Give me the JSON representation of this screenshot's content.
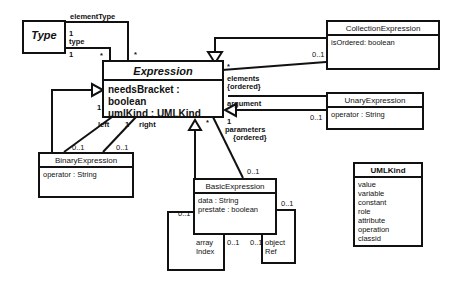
{
  "classes": {
    "type": {
      "name": "Type"
    },
    "expression": {
      "name": "Expression",
      "attributes": [
        "needsBracket : boolean",
        "umlKind : UMLKind"
      ]
    },
    "collection": {
      "name": "CollectionExpression",
      "attributes": [
        "isOrdered: boolean"
      ]
    },
    "unary": {
      "name": "UnaryExpression",
      "attributes": [
        "operator : String"
      ]
    },
    "binary": {
      "name": "BinaryExpression",
      "attributes": [
        "operator : String"
      ]
    },
    "basic": {
      "name": "BasicExpression",
      "attributes": [
        "data : String",
        "prestate : boolean"
      ]
    },
    "umlkind": {
      "name": "UMLKind",
      "literals": [
        "value",
        "variable",
        "constant",
        "role",
        "attribute",
        "operation",
        "classid"
      ]
    }
  },
  "labels": {
    "elementType": "elementType",
    "type_one_a": "1",
    "type_role": "type",
    "type_one_b": "1",
    "star_type": "*",
    "star_elemtype": "*",
    "star_elements": "*",
    "coll_mult": "0..1",
    "elements": "elements",
    "elements_ordered": "{ordered}",
    "argument": "argument",
    "unary_mult": "0..1",
    "param_one": "1",
    "parameters": "parameters",
    "param_ordered": "{ordered}",
    "star_param": "*",
    "basic_param_mult": "0..1",
    "left_one": "1",
    "left": "left",
    "right_one": "1",
    "right": "right",
    "left_mult": "0..1",
    "right_mult": "0..1",
    "array_mult_left": "0..1",
    "array_line1": "array",
    "array_line2": "Index",
    "array_mult_right": "0..1",
    "object_mult_left": "0..1",
    "object_line1": "object",
    "object_line2": "Ref",
    "object_mult_top": "0..1"
  }
}
